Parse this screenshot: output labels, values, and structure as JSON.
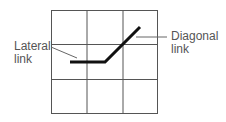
{
  "diagram": {
    "grid": {
      "cols": 3,
      "rows": 3,
      "line_color": "#555555"
    },
    "path": {
      "color": "#111111",
      "description": "horizontal segment followed by diagonal segment"
    },
    "labels": {
      "lateral": {
        "line1": "Lateral",
        "line2": "link"
      },
      "diagonal": {
        "line1": "Diagonal",
        "line2": "link"
      }
    }
  }
}
